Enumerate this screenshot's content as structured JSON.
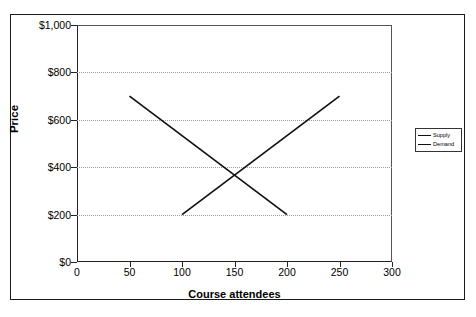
{
  "chart_data": {
    "type": "line",
    "title": "",
    "xlabel": "Course attendees",
    "ylabel": "Price",
    "xlim": [
      0,
      300
    ],
    "ylim": [
      0,
      1000
    ],
    "xticks": [
      0,
      50,
      100,
      150,
      200,
      250,
      300
    ],
    "yticks": [
      0,
      200,
      400,
      600,
      800,
      1000
    ],
    "xtick_labels": [
      "0",
      "50",
      "100",
      "150",
      "200",
      "250",
      "300"
    ],
    "ytick_labels": [
      "$0",
      "$200",
      "$400",
      "$600",
      "$800",
      "$1,000"
    ],
    "grid": "horizontal-dotted",
    "legend_position": "right-outside",
    "series": [
      {
        "name": "Supply",
        "color": "#111111",
        "points": [
          {
            "x": 100,
            "y": 200
          },
          {
            "x": 250,
            "y": 700
          }
        ]
      },
      {
        "name": "Demand",
        "color": "#111111",
        "points": [
          {
            "x": 50,
            "y": 700
          },
          {
            "x": 200,
            "y": 200
          }
        ]
      }
    ],
    "equilibrium": {
      "x": 150,
      "y": 390
    }
  },
  "legend": {
    "items": [
      {
        "label": "Supply"
      },
      {
        "label": "Demand"
      }
    ]
  }
}
